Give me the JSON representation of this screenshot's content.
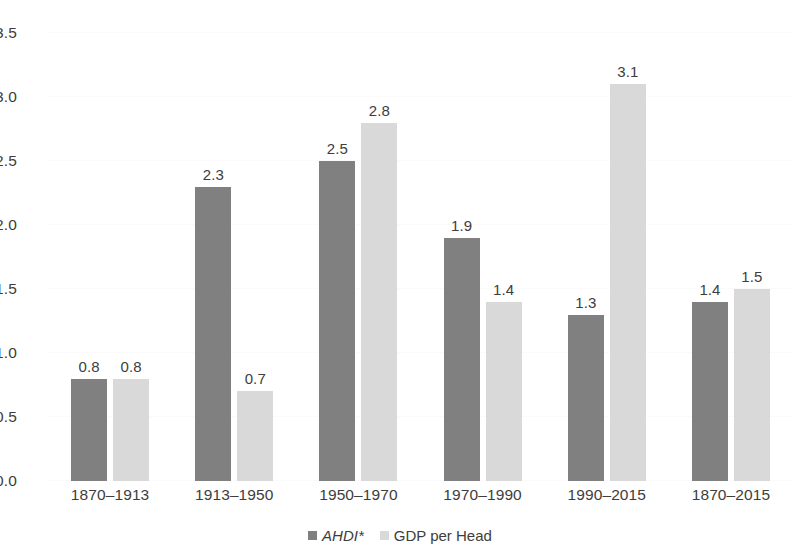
{
  "chart_data": {
    "type": "bar",
    "title": "",
    "xlabel": "",
    "ylabel": "",
    "ylim": [
      0,
      3.5
    ],
    "yticks": [
      "0.0",
      "0.5",
      "1.0",
      "1.5",
      "2.0",
      "2.5",
      "3.0",
      "3.5"
    ],
    "ytick_values": [
      0,
      0.5,
      1.0,
      1.5,
      2.0,
      2.5,
      3.0,
      3.5
    ],
    "grid": true,
    "legend_position": "bottom",
    "categories": [
      "1870–1913",
      "1913–1950",
      "1950–1970",
      "1970–1990",
      "1990–2015",
      "1870–2015"
    ],
    "series": [
      {
        "name": "AHDI*",
        "italic": true,
        "color": "#808080",
        "values": [
          0.8,
          2.3,
          2.5,
          1.9,
          1.3,
          1.4
        ],
        "labels": [
          "0.8",
          "2.3",
          "2.5",
          "1.9",
          "1.3",
          "1.4"
        ]
      },
      {
        "name": "GDP per Head",
        "italic": false,
        "color": "#d9d9d9",
        "values": [
          0.8,
          0.7,
          2.8,
          1.4,
          3.1,
          1.5
        ],
        "labels": [
          "0.8",
          "0.7",
          "2.8",
          "1.4",
          "3.1",
          "1.5"
        ]
      }
    ]
  },
  "colors": {
    "series_ahdi": "#808080",
    "series_gdp": "#d9d9d9",
    "text": "#3d3d3d",
    "gridline": "#fafafa",
    "background": "#ffffff"
  }
}
